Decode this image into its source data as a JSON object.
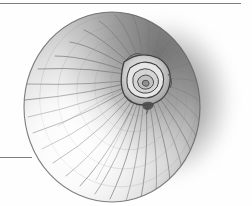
{
  "page": {
    "width": 252,
    "height": 206,
    "background_color": "#ffffff",
    "media": "grayscale pencil / engraving-style botanical illustration"
  },
  "rules": {
    "top": {
      "name": "top-horizontal-rule",
      "x": 0,
      "y": 3,
      "width": 241,
      "height": 1,
      "color": "#7e7e7e"
    },
    "left": {
      "name": "left-horizontal-rule",
      "x": 0,
      "y": 157,
      "width": 32,
      "height": 1,
      "color": "#7e7e7e"
    }
  },
  "illustration": {
    "name": "onion-drawing",
    "bulb": {
      "center_x": 112,
      "center_y": 107,
      "radius_x": 88,
      "radius_y": 95,
      "outline_color": "#5d5d5d",
      "highlight_color": "#fdfdfd",
      "midtone_color": "#c9c9c9",
      "shadow_color": "#8a8a8a"
    },
    "rosette": {
      "name": "onion-neck-rosette",
      "center_x": 145,
      "center_y": 78,
      "radius": 24,
      "ring_count": 5,
      "ink_color": "#3c3c3c",
      "paper_color": "#efefef"
    },
    "fleck": {
      "name": "dark-fleck",
      "center_x": 148,
      "center_y": 106,
      "width": 11,
      "height": 7,
      "color": "#4a4a4a"
    },
    "cast_shadow": {
      "name": "cast-shadow",
      "center_x": 163,
      "center_y": 100,
      "radius_x": 78,
      "radius_y": 90,
      "color": "#8d8d8d"
    },
    "radial_line_count": 34,
    "concentric_line_count": 7,
    "radial_line_color": "#6e6e6e"
  },
  "palette": {
    "paper_white": "#ffffff",
    "highlight": "#fdfdfd",
    "light_gray": "#e3e3e3",
    "mid_gray": "#c0c0c0",
    "shadow_gray": "#8a8a8a",
    "dark_gray": "#5a5a5a",
    "ink_black": "#303030",
    "rule_gray": "#7e7e7e"
  }
}
